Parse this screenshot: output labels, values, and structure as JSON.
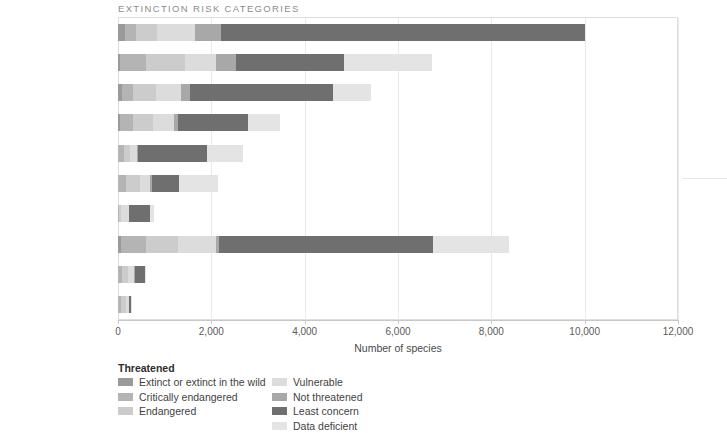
{
  "chart_data": {
    "type": "bar",
    "orientation": "horizontal",
    "stacked": true,
    "title": "EXTINCTION RISK CATEGORIES",
    "xlabel": "Number of species",
    "ylabel": "",
    "xlim": [
      0,
      12000
    ],
    "xticks": [
      0,
      2000,
      4000,
      6000,
      8000,
      10000,
      12000
    ],
    "xtick_labels": [
      "0",
      "2,000",
      "4,000",
      "6,000",
      "8,000",
      "10,000",
      "12,000"
    ],
    "grid": "vertical",
    "legend_position": "bottom-left",
    "categories": [
      "Birds",
      "Amphibians",
      "Mammals",
      "Reptiles",
      "Dragonflies",
      "Freshwater crabs",
      "Corals",
      "Freshwater fish",
      "Conifers",
      "Cycads"
    ],
    "series": [
      {
        "name": "Extinct or extinct in the wild",
        "color": "#9a9a9a",
        "values": [
          160,
          40,
          90,
          35,
          5,
          5,
          0,
          70,
          5,
          5
        ]
      },
      {
        "name": "Critically endangered",
        "color": "#b4b4b4",
        "values": [
          225,
          550,
          225,
          290,
          120,
          170,
          25,
          540,
          90,
          60
        ]
      },
      {
        "name": "Endangered",
        "color": "#cccccc",
        "values": [
          460,
          840,
          510,
          430,
          135,
          290,
          35,
          680,
          110,
          100
        ]
      },
      {
        "name": "Vulnerable",
        "color": "#dcdcdc",
        "values": [
          800,
          660,
          530,
          440,
          140,
          220,
          175,
          800,
          130,
          70
        ]
      },
      {
        "name": "Not threatened",
        "color": "#a8a8a8",
        "values": [
          560,
          430,
          180,
          100,
          30,
          50,
          10,
          70,
          25,
          10
        ]
      },
      {
        "name": "Least concern",
        "color": "#6f6f6f",
        "values": [
          7800,
          2320,
          3070,
          1490,
          1470,
          580,
          445,
          4600,
          230,
          45
        ]
      },
      {
        "name": "Data deficient",
        "color": "#e4e4e4",
        "values": [
          0,
          1900,
          810,
          680,
          770,
          830,
          80,
          1630,
          20,
          10
        ]
      }
    ],
    "totals": [
      10005,
      6740,
      5415,
      3465,
      2670,
      2145,
      770,
      8390,
      610,
      300
    ]
  },
  "legend": {
    "group_heading": "Threatened",
    "left_items": [
      "Extinct or extinct in the wild",
      "Critically endangered",
      "Endangered"
    ],
    "right_items": [
      "Vulnerable",
      "Not threatened",
      "Least concern",
      "Data deficient"
    ]
  }
}
